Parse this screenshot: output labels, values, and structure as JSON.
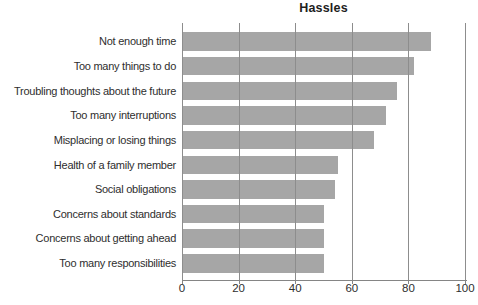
{
  "chart_data": {
    "type": "bar",
    "orientation": "horizontal",
    "title": "Hassles",
    "categories": [
      "Not enough time",
      "Too many things to do",
      "Troubling thoughts about the future",
      "Too many interruptions",
      "Misplacing or losing things",
      "Health of a family member",
      "Social obligations",
      "Concerns about standards",
      "Concerns about getting ahead",
      "Too many responsibilities"
    ],
    "values": [
      88,
      82,
      76,
      72,
      68,
      55,
      54,
      50,
      50,
      50
    ],
    "xlabel": "",
    "ylabel": "",
    "xlim": [
      0,
      100
    ],
    "x_ticks": [
      0,
      20,
      40,
      60,
      80,
      100
    ],
    "grid": true,
    "gridlines_over_bars": true,
    "legend": false,
    "colors": {
      "bar": "#a6a6a6",
      "gridline": "#8d8d8d",
      "axis": "#858585",
      "text": "#2e2e2e",
      "title": "#1e1e1e",
      "background": "#ffffff"
    }
  }
}
